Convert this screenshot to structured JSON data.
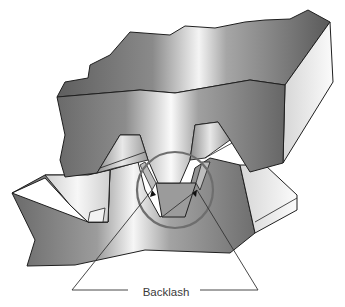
{
  "figure": {
    "callout_label": "Backlash",
    "callout_label_pos": {
      "x": 166,
      "y": 292
    },
    "highlight_circle": {
      "cx": 175,
      "cy": 190,
      "r": 38,
      "color": "#6e6e6e"
    },
    "colors": {
      "outline": "#1f1f1f",
      "dark_face": "#6f6f6f",
      "mid_face": "#9a9a9a",
      "light_face": "#e6e6e6",
      "highlight": "#ffffff",
      "leader_line": "#333333"
    }
  }
}
